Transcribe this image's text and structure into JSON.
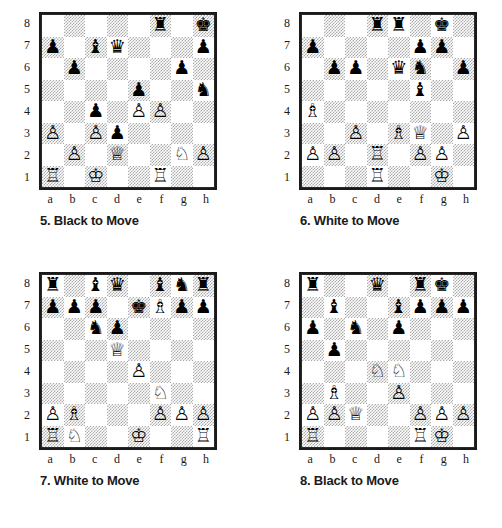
{
  "files": [
    "a",
    "b",
    "c",
    "d",
    "e",
    "f",
    "g",
    "h"
  ],
  "ranks": [
    "8",
    "7",
    "6",
    "5",
    "4",
    "3",
    "2",
    "1"
  ],
  "glyphs": {
    "wk": "♔",
    "wq": "♕",
    "wr": "♖",
    "wb": "♗",
    "wn": "♘",
    "wp": "♙",
    "bk": "♚",
    "bq": "♛",
    "br": "♜",
    "bb": "♝",
    "bn": "♞",
    "bp": "♟"
  },
  "colors": {
    "light_square": "#ffffff",
    "dark_square_hatch": "#ababab",
    "border": "#1a1a1a",
    "text": "#1a1a1a"
  },
  "diagrams": [
    {
      "id": "5",
      "number": "5.",
      "side_to_move": "Black to Move",
      "caption": "5. Black to Move",
      "pieces": {
        "f8": "br",
        "h8": "bk",
        "a7": "bp",
        "c7": "bb",
        "d7": "bq",
        "h7": "bp",
        "b6": "bp",
        "g6": "bp",
        "e5": "bp",
        "h5": "bn",
        "c4": "bp",
        "e4": "wp",
        "f4": "wp",
        "a3": "wp",
        "c3": "wp",
        "d3": "bp",
        "b2": "wp",
        "d2": "wq",
        "g2": "wn",
        "h2": "wp",
        "a1": "wr",
        "c1": "wk",
        "f1": "wr"
      }
    },
    {
      "id": "6",
      "number": "6.",
      "side_to_move": "White to Move",
      "caption": "6. White to Move",
      "pieces": {
        "d8": "br",
        "e8": "br",
        "g8": "bk",
        "a7": "bp",
        "f7": "bp",
        "g7": "bp",
        "b6": "bp",
        "c6": "bp",
        "e6": "bq",
        "f6": "bn",
        "h6": "bp",
        "f5": "bb",
        "a4": "wb",
        "c3": "wp",
        "e3": "wb",
        "f3": "wq",
        "h3": "wp",
        "a2": "wp",
        "b2": "wp",
        "d2": "wr",
        "f2": "wp",
        "g2": "wp",
        "d1": "wr",
        "g1": "wk"
      }
    },
    {
      "id": "7",
      "number": "7.",
      "side_to_move": "White to Move",
      "caption": "7. White to Move",
      "pieces": {
        "a8": "br",
        "c8": "bb",
        "d8": "bq",
        "f8": "bb",
        "g8": "bn",
        "h8": "br",
        "a7": "bp",
        "b7": "bp",
        "c7": "bp",
        "e7": "bk",
        "f7": "wb",
        "g7": "bp",
        "h7": "bp",
        "c6": "bn",
        "d6": "bp",
        "d5": "wq",
        "e4": "wp",
        "f3": "wn",
        "a2": "wp",
        "b2": "wb",
        "f2": "wp",
        "g2": "wp",
        "h2": "wp",
        "a1": "wr",
        "b1": "wn",
        "e1": "wk",
        "h1": "wr"
      }
    },
    {
      "id": "8",
      "number": "8.",
      "side_to_move": "Black to Move",
      "caption": "8. Black to Move",
      "pieces": {
        "a8": "br",
        "d8": "bq",
        "f8": "br",
        "g8": "bk",
        "b7": "bb",
        "e7": "bb",
        "f7": "bp",
        "g7": "bp",
        "h7": "bp",
        "a6": "bp",
        "c6": "bn",
        "e6": "bp",
        "b5": "bp",
        "d4": "wn",
        "e4": "wn",
        "b3": "wb",
        "e3": "wp",
        "a2": "wp",
        "b2": "wp",
        "c2": "wq",
        "f2": "wp",
        "g2": "wp",
        "h2": "wp",
        "a1": "wr",
        "f1": "wr",
        "g1": "wk"
      }
    }
  ]
}
